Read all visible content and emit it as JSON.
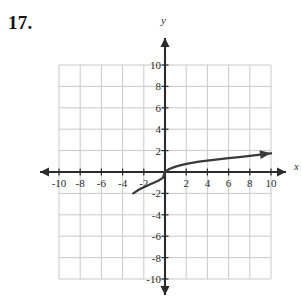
{
  "problem": {
    "number": "17."
  },
  "graph": {
    "y_axis_label": "y",
    "x_axis_label": "x",
    "grid_color": "#c9c9c9",
    "axis_color": "#2b2b2b",
    "curve_color": "#3a3a3a",
    "background": "#ffffff"
  },
  "chart_data": {
    "type": "line",
    "title": "",
    "xlabel": "x",
    "ylabel": "y",
    "xlim": [
      -10,
      10
    ],
    "ylim": [
      -10,
      10
    ],
    "grid": true,
    "legend": "none",
    "x_ticks": [
      -10,
      -8,
      -6,
      -4,
      -2,
      2,
      4,
      6,
      8,
      10
    ],
    "y_ticks": [
      -10,
      -8,
      -6,
      -4,
      -2,
      2,
      4,
      6,
      8,
      10
    ],
    "x_tick_labels": [
      "-10",
      "-8",
      "-6",
      "-4",
      "-2",
      "2",
      "4",
      "6",
      "8",
      "10"
    ],
    "y_tick_labels": [
      "-10",
      "-8",
      "-6",
      "-4",
      "-2",
      "2",
      "4",
      "6",
      "8",
      "10"
    ],
    "series": [
      {
        "name": "cube-root curve",
        "description": "Increasing concave-down-then-up cube root shaped curve passing through the origin, starting near (-3, -2) and ending with an arrowhead near (10, 1.8)",
        "arrow_end": "right",
        "x": [
          -3.0,
          -2.6,
          -2.2,
          -1.8,
          -1.4,
          -1.0,
          -0.6,
          -0.2,
          0.0,
          0.4,
          1.0,
          1.6,
          2.4,
          3.2,
          4.0,
          5.0,
          6.0,
          7.0,
          8.0,
          9.0,
          10.0
        ],
        "y": [
          -2.0,
          -1.74,
          -1.52,
          -1.33,
          -1.15,
          -0.98,
          -0.8,
          -0.55,
          0.0,
          0.28,
          0.5,
          0.66,
          0.83,
          0.96,
          1.06,
          1.18,
          1.29,
          1.4,
          1.51,
          1.62,
          1.75
        ]
      }
    ]
  }
}
